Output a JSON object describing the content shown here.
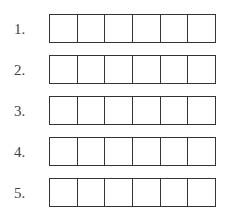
{
  "rows": [
    {
      "label": "1.",
      "cells": [
        "",
        "",
        "",
        "",
        "",
        ""
      ]
    },
    {
      "label": "2.",
      "cells": [
        "",
        "",
        "",
        "",
        "",
        ""
      ]
    },
    {
      "label": "3.",
      "cells": [
        "",
        "",
        "",
        "",
        "",
        ""
      ]
    },
    {
      "label": "4.",
      "cells": [
        "",
        "",
        "",
        "",
        "",
        ""
      ]
    },
    {
      "label": "5.",
      "cells": [
        "",
        "",
        "",
        "",
        "",
        ""
      ]
    }
  ],
  "colors": {
    "border": "#333333",
    "label": "#444444",
    "background": "#ffffff"
  }
}
